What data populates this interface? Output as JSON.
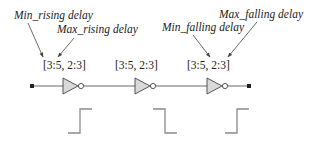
{
  "annotations": [
    {
      "id": "min_rising",
      "text": "Min_rising delay"
    },
    {
      "id": "max_rising",
      "text": "Max_rising delay"
    },
    {
      "id": "min_falling",
      "text": "Min_falling delay"
    },
    {
      "id": "max_falling",
      "text": "Max_falling delay"
    }
  ],
  "gates": [
    {
      "type": "inverter",
      "delay_label": "[3:5, 2:3]"
    },
    {
      "type": "inverter",
      "delay_label": "[3:5, 2:3]"
    },
    {
      "type": "inverter",
      "delay_label": "[3:5, 2:3]"
    }
  ],
  "waveforms": [
    {
      "edge": "rising"
    },
    {
      "edge": "falling"
    },
    {
      "edge": "rising"
    }
  ],
  "colors": {
    "wire": "#555555",
    "gate_fill": "#d9d9d9",
    "gate_stroke": "#444444",
    "waveform": "#8a8a8a",
    "arrow": "#444444"
  }
}
